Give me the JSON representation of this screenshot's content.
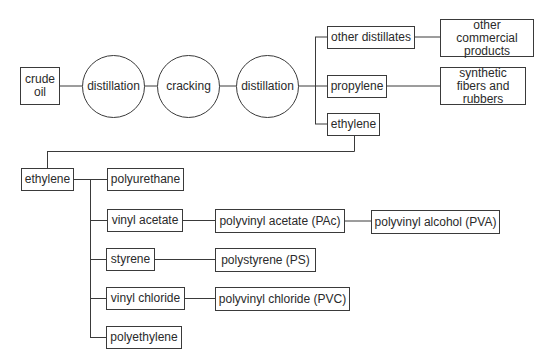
{
  "diagram": {
    "type": "flowchart",
    "title": "",
    "nodes": {
      "crude_oil": "crude oil",
      "distillation_1": "distillation",
      "cracking": "cracking",
      "distillation_2": "distillation",
      "other_distillates": "other distillates",
      "other_commercial_products": "other commercial products",
      "propylene": "propylene",
      "synthetic_fibers_rubbers": "synthetic fibers and rubbers",
      "ethylene_top": "ethylene",
      "ethylene_main": "ethylene",
      "polyurethane": "polyurethane",
      "vinyl_acetate": "vinyl acetate",
      "polyvinyl_acetate": "polyvinyl acetate (PAc)",
      "polyvinyl_alcohol": "polyvinyl alcohol (PVA)",
      "styrene": "styrene",
      "polystyrene": "polystyrene (PS)",
      "vinyl_chloride": "vinyl chloride",
      "polyvinyl_chloride": "polyvinyl chloride (PVC)",
      "polyethylene": "polyethylene"
    },
    "edges": [
      [
        "crude oil",
        "distillation"
      ],
      [
        "distillation",
        "cracking"
      ],
      [
        "cracking",
        "distillation"
      ],
      [
        "distillation",
        "other distillates"
      ],
      [
        "distillation",
        "propylene"
      ],
      [
        "distillation",
        "ethylene"
      ],
      [
        "other distillates",
        "other commercial products"
      ],
      [
        "propylene",
        "synthetic fibers and rubbers"
      ],
      [
        "ethylene",
        "ethylene"
      ],
      [
        "ethylene",
        "polyurethane"
      ],
      [
        "ethylene",
        "vinyl acetate"
      ],
      [
        "ethylene",
        "styrene"
      ],
      [
        "ethylene",
        "vinyl chloride"
      ],
      [
        "ethylene",
        "polyethylene"
      ],
      [
        "vinyl acetate",
        "polyvinyl acetate (PAc)"
      ],
      [
        "polyvinyl acetate (PAc)",
        "polyvinyl alcohol (PVA)"
      ],
      [
        "styrene",
        "polystyrene (PS)"
      ],
      [
        "vinyl chloride",
        "polyvinyl chloride (PVC)"
      ]
    ]
  }
}
